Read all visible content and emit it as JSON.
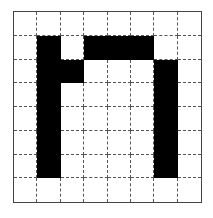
{
  "diagram": {
    "type": "pixel-grid",
    "rows": 8,
    "cols": 8,
    "filled_color": "#000000",
    "empty_color": "#ffffff",
    "grid_line_style": "dashed",
    "cells": [
      [
        0,
        0,
        0,
        0,
        0,
        0,
        0,
        0
      ],
      [
        0,
        1,
        0,
        1,
        1,
        1,
        0,
        0
      ],
      [
        0,
        1,
        1,
        0,
        0,
        0,
        1,
        0
      ],
      [
        0,
        1,
        0,
        0,
        0,
        0,
        1,
        0
      ],
      [
        0,
        1,
        0,
        0,
        0,
        0,
        1,
        0
      ],
      [
        0,
        1,
        0,
        0,
        0,
        0,
        1,
        0
      ],
      [
        0,
        1,
        0,
        0,
        0,
        0,
        1,
        0
      ],
      [
        0,
        0,
        0,
        0,
        0,
        0,
        0,
        0
      ]
    ]
  }
}
